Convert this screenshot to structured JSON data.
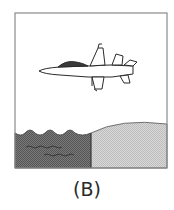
{
  "figure": {
    "caption": "(B)",
    "panel": {
      "subject": "fighter jet flying over boundary between water and land",
      "elements": [
        "jet-aircraft",
        "water-region",
        "land-region",
        "frame-border"
      ]
    },
    "colors": {
      "frame": "#8a8a8a",
      "sky": "#ffffff",
      "water": "#6e6e6e",
      "land": "#cfcfcf",
      "outline": "#2a2a2a",
      "canopy": "#3a3a3a"
    }
  }
}
